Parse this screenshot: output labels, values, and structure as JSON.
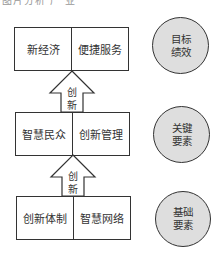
{
  "top_cutoff_text": "图片分析 产 业",
  "levels": [
    {
      "name": "target",
      "cells": [
        "新经济",
        "便捷服务"
      ],
      "circle": {
        "line1": "目标",
        "line2": "绩效"
      }
    },
    {
      "name": "key",
      "cells": [
        "智慧民众",
        "创新管理"
      ],
      "circle": {
        "line1": "关键",
        "line2": "要素"
      }
    },
    {
      "name": "base",
      "cells": [
        "创新体制",
        "智慧网络"
      ],
      "circle": {
        "line1": "基础",
        "line2": "要素"
      }
    }
  ],
  "arrows": [
    {
      "line1": "创",
      "line2": "新"
    },
    {
      "line1": "创",
      "line2": "新"
    }
  ],
  "colors": {
    "circle_fill": "#dedede",
    "stroke": "#333333"
  }
}
